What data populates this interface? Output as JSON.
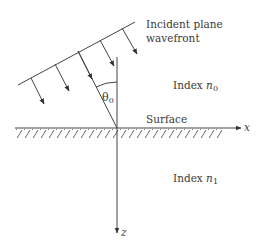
{
  "diagram": {
    "labels": {
      "wavefront_line1": "Incident plane",
      "wavefront_line2": "wavefront",
      "index_top_prefix": "Index ",
      "index_top_symbol": "n",
      "index_top_sub": "0",
      "index_bottom_prefix": "Index ",
      "index_bottom_symbol": "n",
      "index_bottom_sub": "1",
      "surface": "Surface",
      "angle_symbol": "θ",
      "angle_sub": "0",
      "x_axis": "x",
      "z_axis": "z"
    },
    "colors": {
      "line": "#444444",
      "text": "#3a3a3a",
      "background": "#ffffff"
    },
    "geometry": {
      "origin": [
        117,
        128
      ],
      "wavefront": [
        [
          18,
          85
        ],
        [
          135,
          22
        ]
      ],
      "arrows": [
        [
          [
            31,
            78
          ],
          [
            44,
            104
          ]
        ],
        [
          [
            55,
            64
          ],
          [
            69,
            91
          ]
        ],
        [
          [
            100,
            40
          ],
          [
            114,
            66
          ]
        ],
        [
          [
            122,
            28
          ],
          [
            137,
            54
          ]
        ]
      ],
      "incident_ray": [
        [
          78,
          51
        ],
        [
          117,
          128
        ]
      ],
      "normal": [
        [
          117,
          57
        ],
        [
          117,
          128
        ]
      ],
      "x_axis": [
        [
          15,
          128
        ],
        [
          241,
          128
        ]
      ],
      "z_axis": [
        [
          117,
          128
        ],
        [
          117,
          233
        ]
      ]
    }
  }
}
